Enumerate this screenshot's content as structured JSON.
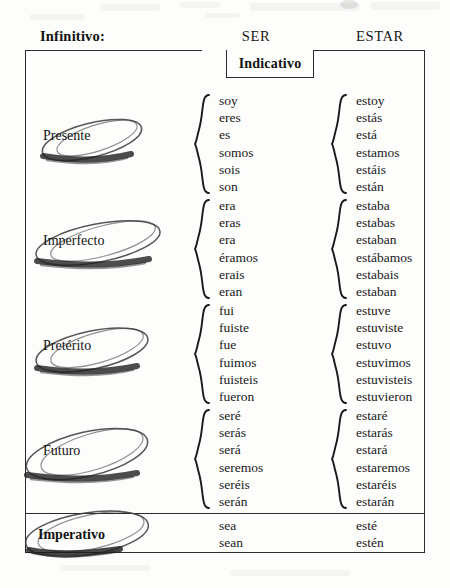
{
  "header": {
    "infinitivo_label": "Infinitivo:",
    "col1": "SER",
    "col2": "ESTAR"
  },
  "mood_tab": {
    "label": "Indicativo"
  },
  "tenses": [
    {
      "name": "Presente",
      "ser": [
        "soy",
        "eres",
        "es",
        "somos",
        "sois",
        "son"
      ],
      "estar": [
        "estoy",
        "estás",
        "está",
        "estamos",
        "estáis",
        "están"
      ]
    },
    {
      "name": "Imperfecto",
      "ser": [
        "era",
        "eras",
        "era",
        "éramos",
        "erais",
        "eran"
      ],
      "estar": [
        "estaba",
        "estabas",
        "estaban",
        "estábamos",
        "estabais",
        "estaban"
      ]
    },
    {
      "name": "Pretérito",
      "ser": [
        "fui",
        "fuiste",
        "fue",
        "fuimos",
        "fuisteis",
        "fueron"
      ],
      "estar": [
        "estuve",
        "estuviste",
        "estuvo",
        "estuvimos",
        "estuvisteis",
        "estuvieron"
      ]
    },
    {
      "name": "Futuro",
      "ser": [
        "seré",
        "serás",
        "será",
        "seremos",
        "seréis",
        "serán"
      ],
      "estar": [
        "estaré",
        "estarás",
        "estará",
        "estaremos",
        "estaréis",
        "estarán"
      ]
    }
  ],
  "imperativo": {
    "name": "Imperativo",
    "ser": [
      "sea",
      "sean"
    ],
    "estar": [
      "esté",
      "estén"
    ]
  },
  "colors": {
    "ink": "#1a1a1a",
    "rule": "#2b2b2b",
    "annotation": "#3a3a3a",
    "paper": "#fdfdfc"
  }
}
